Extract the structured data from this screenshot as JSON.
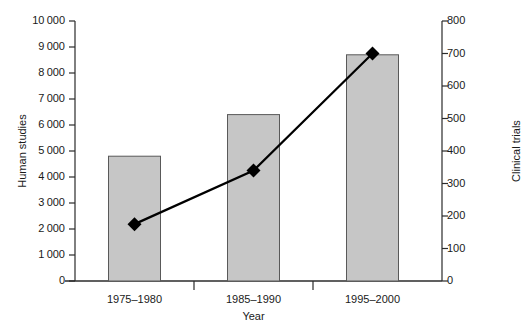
{
  "chart_data": {
    "type": "bar",
    "title": "",
    "subtitle": "",
    "xlabel": "Year",
    "categories": [
      "1975–1980",
      "1985–1990",
      "1995–2000"
    ],
    "grid": false,
    "legend": "none",
    "series": [
      {
        "name": "Human studies",
        "type": "bar",
        "axis": "left",
        "values": [
          4800,
          6400,
          8700
        ],
        "color": "#c6c6c6",
        "border_color": "#595959"
      },
      {
        "name": "Clinical trials",
        "type": "line",
        "axis": "right",
        "values": [
          175,
          340,
          700
        ],
        "color": "#000000",
        "marker": "diamond"
      }
    ],
    "axes": {
      "left": {
        "label": "Human studies",
        "min": 0,
        "max": 10000,
        "step": 1000,
        "ticks": [
          0,
          1000,
          2000,
          3000,
          4000,
          5000,
          6000,
          7000,
          8000,
          9000,
          10000
        ],
        "tick_labels": [
          "0",
          "1 000",
          "2 000",
          "3 000",
          "4 000",
          "5 000",
          "6 000",
          "7 000",
          "8 000",
          "9 000",
          "10 000"
        ]
      },
      "right": {
        "label": "Clinical trials",
        "min": 0,
        "max": 800,
        "step": 100,
        "ticks": [
          0,
          100,
          200,
          300,
          400,
          500,
          600,
          700,
          800
        ],
        "tick_labels": [
          "0",
          "100",
          "200",
          "300",
          "400",
          "500",
          "600",
          "700",
          "800"
        ]
      },
      "x": {
        "label": "Year",
        "tick_labels": [
          "1975–1980",
          "1985–1990",
          "1995–2000"
        ]
      }
    }
  }
}
